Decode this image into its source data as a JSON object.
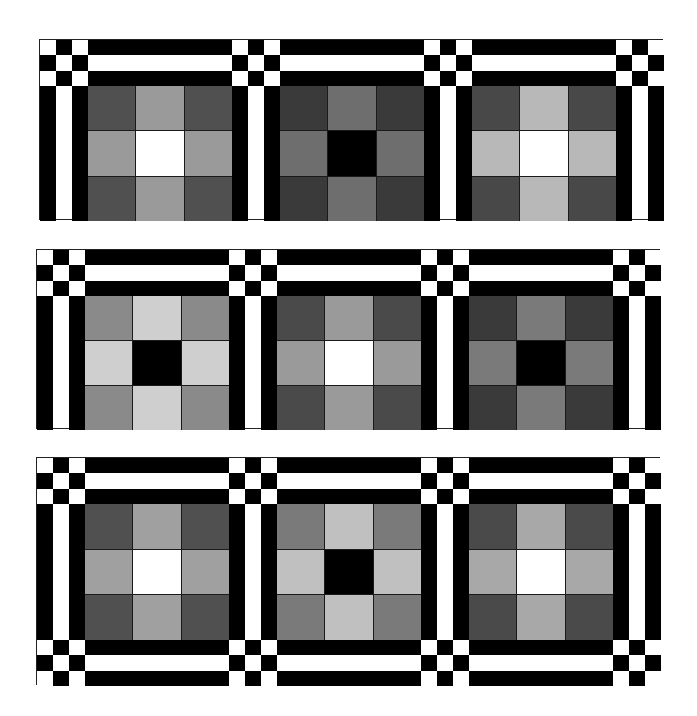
{
  "figure": {
    "type": "quilt-pattern",
    "layout": {
      "rows": 3,
      "blocks_per_row": 3
    },
    "sashing": {
      "strip_colors": [
        "#000000",
        "#ffffff",
        "#000000"
      ],
      "cornerstone_checker": [
        [
          "#ffffff",
          "#000000",
          "#ffffff"
        ],
        [
          "#000000",
          "#ffffff",
          "#000000"
        ],
        [
          "#ffffff",
          "#000000",
          "#ffffff"
        ]
      ]
    },
    "rows": [
      {
        "name": "row-1",
        "top_sashing": true,
        "bottom_sashing": false,
        "blocks": [
          {
            "corner": "#505050",
            "edge": "#9a9a9a",
            "center": "#ffffff"
          },
          {
            "corner": "#3a3a3a",
            "edge": "#6e6e6e",
            "center": "#000000"
          },
          {
            "corner": "#484848",
            "edge": "#b8b8b8",
            "center": "#ffffff"
          }
        ]
      },
      {
        "name": "row-2",
        "top_sashing": true,
        "bottom_sashing": false,
        "blocks": [
          {
            "corner": "#8a8a8a",
            "edge": "#cfcfcf",
            "center": "#000000"
          },
          {
            "corner": "#4a4a4a",
            "edge": "#9a9a9a",
            "center": "#ffffff"
          },
          {
            "corner": "#3a3a3a",
            "edge": "#7a7a7a",
            "center": "#000000"
          }
        ]
      },
      {
        "name": "row-3",
        "top_sashing": true,
        "bottom_sashing": true,
        "blocks": [
          {
            "corner": "#505050",
            "edge": "#a0a0a0",
            "center": "#ffffff"
          },
          {
            "corner": "#7a7a7a",
            "edge": "#c0c0c0",
            "center": "#000000"
          },
          {
            "corner": "#4a4a4a",
            "edge": "#a8a8a8",
            "center": "#ffffff"
          }
        ]
      }
    ]
  }
}
